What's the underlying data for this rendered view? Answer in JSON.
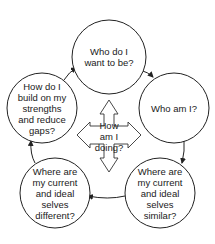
{
  "diagram": {
    "nodes": [
      {
        "id": "ideal-self",
        "lines": [
          "Who do I",
          "want to be?"
        ],
        "cx": 109,
        "cy": 57,
        "r": 37
      },
      {
        "id": "real-self",
        "lines": [
          "Who am I?"
        ],
        "cx": 174,
        "cy": 108,
        "r": 35
      },
      {
        "id": "similar",
        "lines": [
          "Where are",
          "my current",
          "and ideal",
          "selves",
          "similar?"
        ],
        "cx": 160,
        "cy": 193,
        "r": 35
      },
      {
        "id": "different",
        "lines": [
          "Where are",
          "my current",
          "and ideal",
          "selves",
          "different?"
        ],
        "cx": 55,
        "cy": 193,
        "r": 35
      },
      {
        "id": "build",
        "lines": [
          "How do I",
          "build on my",
          "strengths",
          "and reduce",
          "gaps?"
        ],
        "cx": 42,
        "cy": 108,
        "r": 35
      }
    ],
    "center": {
      "id": "how-am-i-doing",
      "lines": [
        "How",
        "am I",
        "doing?"
      ],
      "cx": 109,
      "cy": 136
    },
    "edges": [
      {
        "from": "ideal-self",
        "to": "real-self"
      },
      {
        "from": "real-self",
        "to": "similar"
      },
      {
        "from": "similar",
        "to": "different"
      },
      {
        "from": "different",
        "to": "build"
      },
      {
        "from": "build",
        "to": "ideal-self"
      }
    ],
    "colors": {
      "stroke": "#222222",
      "fill": "#ffffff",
      "text": "#1a1a1a"
    }
  }
}
